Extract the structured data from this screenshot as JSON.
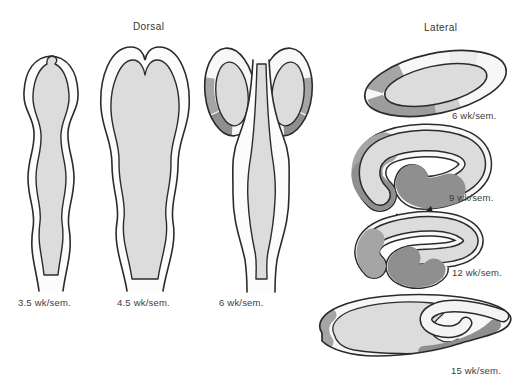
{
  "diagram": {
    "views": {
      "dorsal": {
        "title": "Dorsal",
        "stages": [
          {
            "label": "3.5 wk/sem."
          },
          {
            "label": "4.5 wk/sem."
          },
          {
            "label": "6 wk/sem."
          }
        ]
      },
      "lateral": {
        "title": "Lateral",
        "stages": [
          {
            "label": "6 wk/sem."
          },
          {
            "label": "9 wk/sem."
          },
          {
            "label": "12 wk/sem."
          },
          {
            "label": "15 wk/sem."
          }
        ]
      }
    },
    "colors": {
      "outline": "#2b2b2b",
      "rim_white": "#f8f8f8",
      "core_gray": "#dcdcdc",
      "medium_gray": "#a5a5a5",
      "dark_gray": "#8f8f8f",
      "background": "#ffffff"
    },
    "icons": [
      {
        "name": "rotation-arrow-icon"
      }
    ]
  }
}
